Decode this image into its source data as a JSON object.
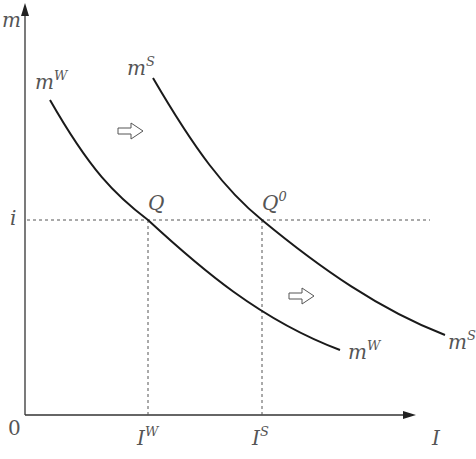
{
  "diagram": {
    "axes": {
      "y_label": "m",
      "x_label": "I",
      "origin_label": "0"
    },
    "curves": [
      {
        "name": "m",
        "superscript": "W",
        "label_top": "m",
        "label_top_sup": "W",
        "label_end": "m",
        "label_end_sup": "W"
      },
      {
        "name": "m",
        "superscript": "S",
        "label_top": "m",
        "label_top_sup": "S",
        "label_end": "m",
        "label_end_sup": "S"
      }
    ],
    "points": [
      {
        "label": "Q",
        "sup": ""
      },
      {
        "label": "Q",
        "sup": "0"
      }
    ],
    "y_ticks": [
      {
        "label": "i"
      }
    ],
    "x_ticks": [
      {
        "label": "I",
        "sup": "W"
      },
      {
        "label": "I",
        "sup": "S"
      }
    ],
    "shift_arrows": [
      {
        "direction": "right"
      },
      {
        "direction": "right"
      }
    ],
    "colors": {
      "curve": "#1a1a1a",
      "axis": "#333333",
      "dashed": "#555555",
      "text": "#555555"
    }
  }
}
